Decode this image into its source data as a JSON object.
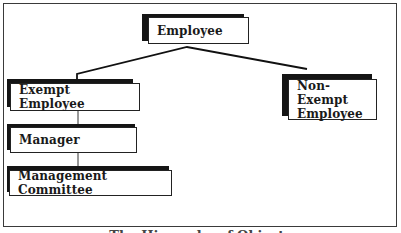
{
  "diagram": {
    "type": "class-hierarchy",
    "nodes": [
      {
        "id": "employee",
        "label": "Employee"
      },
      {
        "id": "exempt",
        "label": "Exempt Employee"
      },
      {
        "id": "nonexempt",
        "label": "Non-Exempt Employee",
        "lines": [
          "Non-Exempt",
          "Employee"
        ]
      },
      {
        "id": "manager",
        "label": "Manager"
      },
      {
        "id": "committee",
        "label": "Management Committee"
      }
    ],
    "edges": [
      {
        "from": "employee",
        "to": "exempt"
      },
      {
        "from": "employee",
        "to": "nonexempt"
      },
      {
        "from": "exempt",
        "to": "manager"
      },
      {
        "from": "manager",
        "to": "committee"
      }
    ],
    "caption": "The Hierarchy of Objects",
    "colors": {
      "shadow": "#151515",
      "border": "#222222",
      "text": "#1a1a1a"
    }
  }
}
